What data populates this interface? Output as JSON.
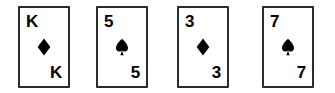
{
  "scene": {
    "name": "playing-card-row",
    "background_color": "#ffffff",
    "card_count": 4,
    "card_border_color": "#2b2b2b",
    "card_face_color": "#ffffff",
    "pip_color": "#000000"
  },
  "cards": [
    {
      "rank": "K",
      "suit_name": "diamond",
      "suit_symbol": "♦",
      "label": "K of diamonds",
      "pip_color": "#000000"
    },
    {
      "rank": "5",
      "suit_name": "spade",
      "suit_symbol": "♠",
      "label": "5 of spades",
      "pip_color": "#000000"
    },
    {
      "rank": "3",
      "suit_name": "diamond",
      "suit_symbol": "♦",
      "label": "3 of diamonds",
      "pip_color": "#000000"
    },
    {
      "rank": "7",
      "suit_name": "spade",
      "suit_symbol": "♠",
      "label": "7 of spades",
      "pip_color": "#000000"
    }
  ]
}
